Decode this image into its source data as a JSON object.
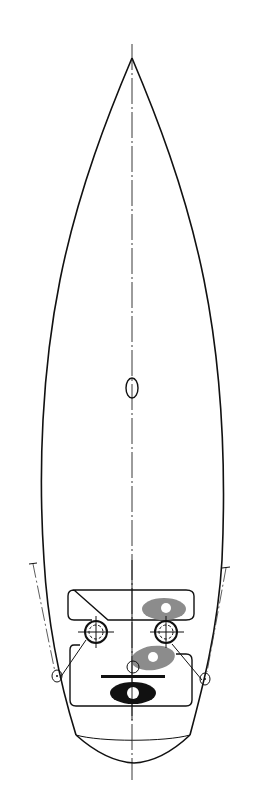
{
  "diagram": {
    "type": "sailboat-deck-plan",
    "view": "top",
    "colors": {
      "line": "#111111",
      "gray_fill": "#8c8c8c",
      "background": "#ffffff"
    },
    "elements": [
      {
        "name": "hull-outline",
        "description": "pointed bow at top, wide transom at bottom"
      },
      {
        "name": "centerline",
        "style": "dash-dot"
      },
      {
        "name": "mast-step",
        "shape": "ellipse"
      },
      {
        "name": "cockpit",
        "shape": "rounded outline"
      },
      {
        "name": "port-winch"
      },
      {
        "name": "starboard-winch"
      },
      {
        "name": "port-sheet-lead"
      },
      {
        "name": "starboard-sheet-lead"
      },
      {
        "name": "port-shroud-track",
        "style": "dash-dot"
      },
      {
        "name": "starboard-shroud-track",
        "style": "dash-dot"
      },
      {
        "name": "helm-seat-gray-upper",
        "fill": "gray"
      },
      {
        "name": "helm-seat-gray-lower",
        "fill": "gray"
      },
      {
        "name": "helm-position-black",
        "fill": "black"
      },
      {
        "name": "traveler-bar"
      },
      {
        "name": "stern-transom"
      }
    ]
  }
}
